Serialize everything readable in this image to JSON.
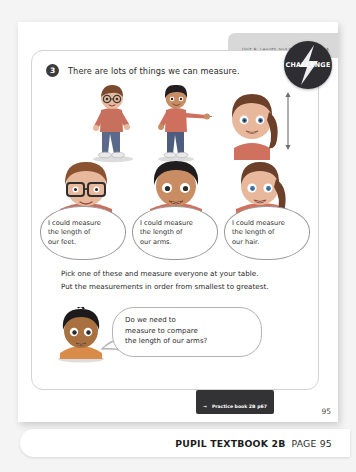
{
  "header": {
    "unit_label": "Unit 8: Length and height; Lesson 4"
  },
  "badge": {
    "label": "CHALLENGE",
    "icon": "lightning-bolt-icon"
  },
  "question": {
    "number": "3",
    "text": "There are lots of things we can measure."
  },
  "figures": [
    {
      "name": "boy-with-glasses-measuring-feet",
      "measures": "feet"
    },
    {
      "name": "boy-pointing-arm",
      "measures": "arms"
    },
    {
      "name": "girl-with-ponytail-hair",
      "measures": "hair"
    }
  ],
  "busts": [
    {
      "name": "bust-boy-glasses"
    },
    {
      "name": "bust-boy-dark-hair"
    },
    {
      "name": "bust-girl-ponytail"
    }
  ],
  "speech_bubbles": [
    {
      "line1": "I could measure",
      "line2": "the length of",
      "line3": "our feet."
    },
    {
      "line1": "I could measure",
      "line2": "the length of",
      "line3": "our arms."
    },
    {
      "line1": "I could measure",
      "line2": "the length of",
      "line3": "our hair."
    }
  ],
  "instructions": {
    "line1": "Pick one of these and measure everyone at your table.",
    "line2": "Put the measurements in order from smallest to greatest."
  },
  "bottom_bubble": {
    "line1": "Do we need to",
    "line2": "measure to compare",
    "line3": "the length of our arms?"
  },
  "seated_character": {
    "name": "seated-child-dark-hair"
  },
  "page_number": "95",
  "practice_tag": {
    "arrow": "→",
    "text": "Practice book 2B p67"
  },
  "footer": {
    "title": "PUPIL TEXTBOOK 2B",
    "page_label": "PAGE 95"
  },
  "colors": {
    "badge_bg": "#2e2e32",
    "tag_bg": "#333336",
    "strip_bg": "#d8d8d8",
    "page_bg": "#ffffff",
    "canvas_bg": "#f4f4f4"
  }
}
